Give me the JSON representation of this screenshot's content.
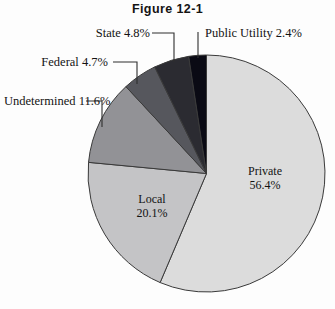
{
  "figure": {
    "title": "Figure 12-1"
  },
  "chart_data": {
    "type": "pie",
    "title": "Figure 12-1",
    "xlabel": "",
    "ylabel": "",
    "legend_position": "none",
    "grid": false,
    "start_angle_deg": 0,
    "direction": "clockwise",
    "units": "percent",
    "categories": [
      "Private",
      "Local",
      "Undetermined",
      "Federal",
      "State",
      "Public Utility"
    ],
    "values": [
      56.4,
      20.1,
      11.6,
      4.7,
      4.8,
      2.4
    ],
    "slices": [
      {
        "name": "Private",
        "value": 56.4,
        "label": "Private",
        "value_label": "56.4%",
        "color": "#dcdcdc",
        "label_placement": "inside"
      },
      {
        "name": "Local",
        "value": 20.1,
        "label": "Local",
        "value_label": "20.1%",
        "color": "#c4c4c6",
        "label_placement": "inside"
      },
      {
        "name": "Undetermined",
        "value": 11.6,
        "label": "Undetermined",
        "value_label": "11.6%",
        "color": "#929296",
        "label_placement": "callout"
      },
      {
        "name": "Federal",
        "value": 4.7,
        "label": "Federal",
        "value_label": "4.7%",
        "color": "#56575d",
        "label_placement": "callout"
      },
      {
        "name": "State",
        "value": 4.8,
        "label": "State",
        "value_label": "4.8%",
        "color": "#2b2b31",
        "label_placement": "callout"
      },
      {
        "name": "Public Utility",
        "value": 2.4,
        "label": "Public Utility",
        "value_label": "2.4%",
        "color": "#0a0a14",
        "label_placement": "callout"
      }
    ],
    "callout_text": {
      "public_utility": "Public Utility 2.4%",
      "state": "State 4.8%",
      "federal": "Federal 4.7%",
      "undetermined_line1": "Undetermined",
      "undetermined_line2": "11.6%"
    }
  },
  "colors": {
    "background": "#fdfdfd",
    "outline": "#3a3a3a",
    "text": "#131313",
    "leader_line": "#2e2e2e"
  }
}
